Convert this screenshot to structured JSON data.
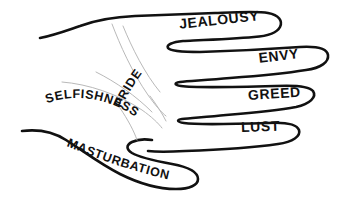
{
  "diagram": {
    "type": "line-drawing",
    "colors": {
      "outline": "#111111",
      "crease": "#b9b9b9",
      "background": "#ffffff",
      "text": "#111111"
    },
    "labels": {
      "finger_index": "JEALOUSY",
      "finger_middle": "ENVY",
      "finger_ring": "GREED",
      "finger_pinky": "LUST",
      "thumb": "MASTURBATION",
      "palm_upper": "PRIDE",
      "palm_lower": "SELFISHNESS"
    },
    "parts": [
      {
        "name": "index-finger",
        "label": "JEALOUSY",
        "orientation": "straight-tilted"
      },
      {
        "name": "middle-finger",
        "label": "ENVY",
        "orientation": "straight-tilted"
      },
      {
        "name": "ring-finger",
        "label": "GREED",
        "orientation": "straight"
      },
      {
        "name": "pinky-finger",
        "label": "LUST",
        "orientation": "straight"
      },
      {
        "name": "thumb",
        "label": "MASTURBATION",
        "orientation": "curved-arc"
      },
      {
        "name": "palm-upper",
        "label": "PRIDE",
        "orientation": "curved-arc-diagonal"
      },
      {
        "name": "palm-lower",
        "label": "SELFISHNESS",
        "orientation": "curved-arc"
      }
    ]
  }
}
